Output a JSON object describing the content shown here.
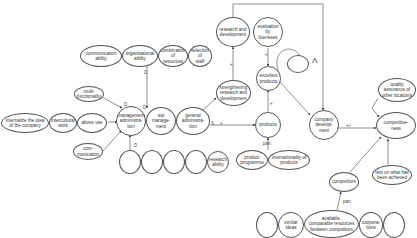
{
  "diagram": {
    "nodes": {
      "communication_ability": "communication\nability",
      "organisational_ability": "organisational\nability",
      "combination_of_resources": "combination\nof resources",
      "selection_of_staff": "selection of\nstaff",
      "multi_functionality": "multi-\nfunctionality",
      "internalize": "internalize the idea\nof the company",
      "intercultural_work": "intercultural\nwork",
      "above_use": "above use",
      "communication": "com-\nmunication",
      "management_administration": "management\nadministra-\ntion",
      "top_management": "top manage-\nment",
      "general_administration": "general\nadministra-\ntion",
      "research_ability": "research\nability",
      "research_and_development": "research and\ndevelopment",
      "evaluation_by_licensees": "evaluation\nby licensees",
      "strengthening_rd": "strengthening\nresearch and\ndevelopment",
      "excellent_products": "excellent\nproducts",
      "products": "products",
      "product_programme": "product\nprogramme",
      "internationality_of_products": "internationality of\nproducts",
      "company_development": "company\ndevelop-\nment",
      "quality_assurance": "quality\nassurance of\nother locations",
      "competitiveness": "competitive-\nness",
      "competitors": "competitors",
      "rest_on_achieved": "rest on what has\nbeen achieved",
      "similar_ideas": "similar\nideas",
      "available_resources": "available,\ncomparable resources\nbetween competitors",
      "cooperations": "coopera-\ntions"
    },
    "edge_labels": {
      "d": "D",
      "plus": "+",
      "part": "part",
      "plus_minus": "+/-",
      "s": "S",
      "loop": "Λ"
    }
  }
}
